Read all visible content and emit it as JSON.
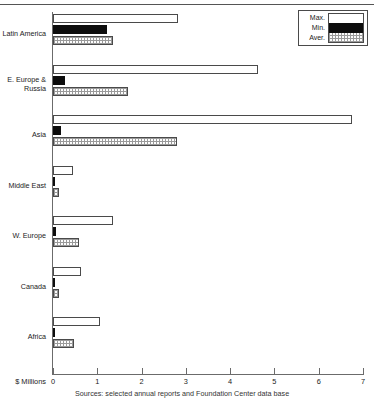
{
  "chart_data": {
    "type": "bar",
    "orientation": "horizontal",
    "title": "",
    "xlabel": "$ Millions",
    "ylabel": "",
    "xlim": [
      0,
      7
    ],
    "xticks": [
      0,
      1,
      2,
      3,
      4,
      5,
      6,
      7
    ],
    "xtick_labels": [
      "0",
      "1",
      "2",
      "3",
      "4",
      "5",
      "6",
      "7"
    ],
    "grid": false,
    "legend_position": "top-right",
    "categories": [
      "Latin America",
      "E. Europe &\nRussia",
      "Asia",
      "Middle East",
      "W. Europe",
      "Canada",
      "Africa"
    ],
    "series": [
      {
        "name": "Max.",
        "values": [
          2.82,
          4.63,
          6.75,
          0.45,
          1.36,
          0.63,
          1.07
        ]
      },
      {
        "name": "Min.",
        "values": [
          1.23,
          0.27,
          0.18,
          0.03,
          0.06,
          0.02,
          0.02
        ]
      },
      {
        "name": "Aver.",
        "values": [
          1.36,
          1.7,
          2.8,
          0.14,
          0.58,
          0.14,
          0.48
        ]
      }
    ],
    "annotations": [
      "Sources: selected annual reports and Foundation Center data base"
    ]
  },
  "legend": {
    "items": [
      {
        "label": "Max.",
        "swatch": "white-fill"
      },
      {
        "label": "Min.",
        "swatch": "black-fill"
      },
      {
        "label": "Aver.",
        "swatch": "grid-hatch-fill"
      }
    ]
  },
  "axis": {
    "x_title": "$ Millions",
    "tick_labels": [
      "0",
      "1",
      "2",
      "3",
      "4",
      "5",
      "6",
      "7"
    ]
  },
  "footer": {
    "source": "Sources: selected annual reports and Foundation Center data base"
  },
  "colors": {
    "max_fill": "#ffffff",
    "min_fill": "#0d0d0d",
    "aver_fill": "#fdfdfd",
    "aver_hatch": "#9a9a9a",
    "bar_stroke": "#4a4a4a",
    "axis": "#6b6b6b",
    "text": "#222222",
    "background": "#ffffff"
  }
}
